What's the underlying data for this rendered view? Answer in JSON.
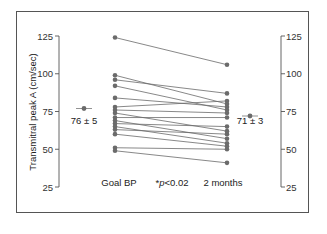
{
  "chart_data": {
    "type": "line",
    "subtype": "paired-slopegraph",
    "title": "",
    "ylabel": "Transmitral peak A (cm/sec)",
    "xlabel": "",
    "categories": [
      "Goal BP",
      "2 months"
    ],
    "annotation_center": "*p<0.02",
    "ylim": [
      25,
      125
    ],
    "yticks": [
      25,
      50,
      75,
      100,
      125
    ],
    "grid": false,
    "legend": null,
    "summary": {
      "left": {
        "label": "76 ± 5",
        "mean": 76,
        "se": 5
      },
      "right": {
        "label": "71 ± 3",
        "mean": 71,
        "se": 3
      }
    },
    "series": [
      {
        "name": "subject-1",
        "values": [
          124,
          106
        ]
      },
      {
        "name": "subject-2",
        "values": [
          99,
          80
        ]
      },
      {
        "name": "subject-3",
        "values": [
          96,
          87
        ]
      },
      {
        "name": "subject-4",
        "values": [
          92,
          76
        ]
      },
      {
        "name": "subject-5",
        "values": [
          84,
          78
        ]
      },
      {
        "name": "subject-6",
        "values": [
          78,
          82
        ]
      },
      {
        "name": "subject-7",
        "values": [
          76,
          74
        ]
      },
      {
        "name": "subject-8",
        "values": [
          74,
          62
        ]
      },
      {
        "name": "subject-9",
        "values": [
          71,
          71
        ]
      },
      {
        "name": "subject-10",
        "values": [
          69,
          57
        ]
      },
      {
        "name": "subject-11",
        "values": [
          67,
          65
        ]
      },
      {
        "name": "subject-12",
        "values": [
          65,
          54
        ]
      },
      {
        "name": "subject-13",
        "values": [
          63,
          60
        ]
      },
      {
        "name": "subject-14",
        "values": [
          60,
          52
        ]
      },
      {
        "name": "subject-15",
        "values": [
          51,
          50
        ]
      },
      {
        "name": "subject-16",
        "values": [
          49,
          41
        ]
      }
    ]
  },
  "labels": {
    "ylabel": "Transmitral peak A (cm/sec)",
    "left_category": "Goal BP",
    "right_category": "2 months",
    "p_value_prefix": "*",
    "p_value_var": "p",
    "p_value_rest": "<0.02",
    "left_summary": "76 ± 5",
    "right_summary": "71 ± 3"
  },
  "colors": {
    "line": "#6a6a6a",
    "marker": "#6b6b6b",
    "axis": "#555555",
    "text": "#222222"
  }
}
